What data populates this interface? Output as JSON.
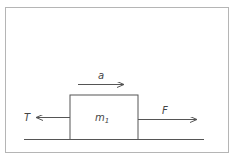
{
  "diagram": {
    "type": "free-body-diagram",
    "colors": {
      "frame": "#b5b5b5",
      "stroke": "#555555",
      "text": "#444444",
      "background": "#ffffff"
    },
    "block": {
      "label": "m",
      "subscript": "1"
    },
    "forces": [
      {
        "id": "tension",
        "label": "T",
        "direction": "left"
      },
      {
        "id": "applied",
        "label": "F",
        "direction": "right"
      }
    ],
    "acceleration": {
      "label": "a",
      "direction": "right"
    }
  }
}
